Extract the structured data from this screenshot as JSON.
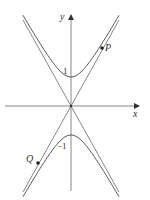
{
  "figure": {
    "axes": {
      "x_label": "x",
      "y_label": "y"
    },
    "tick_labels": {
      "upper_vertex": "1",
      "lower_vertex": "−1"
    },
    "points": [
      {
        "label": "P",
        "branch": "upper",
        "side": "right"
      },
      {
        "label": "Q",
        "branch": "lower",
        "side": "left"
      }
    ],
    "colors": {
      "curve": "#555555",
      "axis": "#777777",
      "point": "#222222"
    }
  }
}
